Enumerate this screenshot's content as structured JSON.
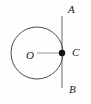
{
  "figure": {
    "kind": "geometry-diagram",
    "width": 91,
    "height": 104,
    "background_color": "#fefefe",
    "stroke_color": "#4a4a4a",
    "tangent_color": "#8a8a8a",
    "radius_color": "#b5b5b5",
    "point_color": "#111111",
    "label_color": "#1a1a1a",
    "circle": {
      "name": "circle",
      "center_x": 37,
      "center_y": 53,
      "radius": 26,
      "stroke_width": 1
    },
    "tangent_line": {
      "name": "tangent-line-AB",
      "x": 62,
      "y_top": 16,
      "y_bottom": 88,
      "stroke_width": 1.3
    },
    "radius_segment": {
      "name": "radius-OC",
      "x1": 37,
      "y1": 53,
      "x2": 62,
      "y2": 53,
      "stroke_width": 1.4
    },
    "point_C": {
      "name": "point-C",
      "cx": 62,
      "cy": 53,
      "r": 3.2
    },
    "labels": {
      "A": "A",
      "B": "B",
      "C": "C",
      "O": "O"
    }
  }
}
